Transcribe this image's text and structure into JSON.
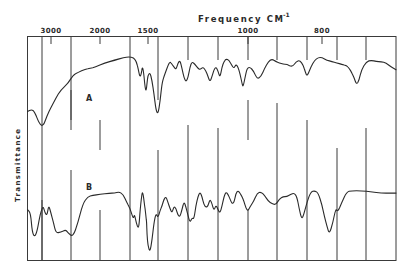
{
  "chart_data": {
    "type": "line",
    "title": "Frequency  CM",
    "title_superscript": "-1",
    "xlabel": "Frequency CM-1",
    "ylabel": "Transmittance",
    "x_axis_position": "top",
    "x_direction": "decreasing",
    "x_ticks": [
      {
        "value": 3000,
        "label": "3000"
      },
      {
        "value": 2000,
        "label": "2000"
      },
      {
        "value": 1500,
        "label": "1500"
      },
      {
        "value": 1000,
        "label": "1000"
      },
      {
        "value": 800,
        "label": "800"
      }
    ],
    "xlim": [
      3600,
      650
    ],
    "ylim": [
      0,
      100
    ],
    "grid": true,
    "legend": "inline-labels",
    "series": [
      {
        "name": "A",
        "points": [
          [
            3600,
            47
          ],
          [
            3500,
            48.5
          ],
          [
            3420,
            47
          ],
          [
            3300,
            38
          ],
          [
            3200,
            36
          ],
          [
            3100,
            44
          ],
          [
            3000,
            50
          ],
          [
            2900,
            57
          ],
          [
            2800,
            63
          ],
          [
            2650,
            68
          ],
          [
            2550,
            74
          ],
          [
            2450,
            76
          ],
          [
            2300,
            78.5
          ],
          [
            2200,
            79
          ],
          [
            2100,
            80
          ],
          [
            1950,
            83
          ],
          [
            1850,
            85
          ],
          [
            1750,
            87
          ],
          [
            1700,
            87.5
          ],
          [
            1650,
            87
          ],
          [
            1620,
            84
          ],
          [
            1600,
            78
          ],
          [
            1590,
            74
          ],
          [
            1580,
            73
          ],
          [
            1570,
            75
          ],
          [
            1560,
            80
          ],
          [
            1550,
            78
          ],
          [
            1540,
            72
          ],
          [
            1530,
            65
          ],
          [
            1520,
            62
          ],
          [
            1510,
            68
          ],
          [
            1500,
            74
          ],
          [
            1490,
            76
          ],
          [
            1480,
            70
          ],
          [
            1470,
            60
          ],
          [
            1460,
            48
          ],
          [
            1450,
            45
          ],
          [
            1440,
            54
          ],
          [
            1430,
            68
          ],
          [
            1420,
            73
          ],
          [
            1410,
            77
          ],
          [
            1400,
            81
          ],
          [
            1390,
            84
          ],
          [
            1380,
            82
          ],
          [
            1370,
            80
          ],
          [
            1360,
            78
          ],
          [
            1350,
            83
          ],
          [
            1340,
            85
          ],
          [
            1330,
            79
          ],
          [
            1320,
            72
          ],
          [
            1310,
            69
          ],
          [
            1300,
            72
          ],
          [
            1290,
            80
          ],
          [
            1280,
            84
          ],
          [
            1265,
            82
          ],
          [
            1250,
            79
          ],
          [
            1240,
            78
          ],
          [
            1225,
            80
          ],
          [
            1210,
            77
          ],
          [
            1200,
            73
          ],
          [
            1190,
            69
          ],
          [
            1180,
            73
          ],
          [
            1170,
            78
          ],
          [
            1160,
            80
          ],
          [
            1150,
            77
          ],
          [
            1140,
            72
          ],
          [
            1130,
            80
          ],
          [
            1120,
            84
          ],
          [
            1110,
            86
          ],
          [
            1095,
            85
          ],
          [
            1080,
            81
          ],
          [
            1070,
            79
          ],
          [
            1060,
            82
          ],
          [
            1050,
            80
          ],
          [
            1040,
            75
          ],
          [
            1030,
            68
          ],
          [
            1025,
            65
          ],
          [
            1015,
            72
          ],
          [
            1005,
            79
          ],
          [
            995,
            80
          ],
          [
            985,
            77
          ],
          [
            975,
            71
          ],
          [
            965,
            73
          ],
          [
            955,
            79
          ],
          [
            945,
            84
          ],
          [
            935,
            86
          ],
          [
            925,
            84
          ],
          [
            915,
            83
          ],
          [
            905,
            82
          ],
          [
            895,
            82
          ],
          [
            880,
            80
          ],
          [
            870,
            84
          ],
          [
            860,
            85
          ],
          [
            850,
            81
          ],
          [
            845,
            76
          ],
          [
            840,
            73
          ],
          [
            830,
            80
          ],
          [
            820,
            85
          ],
          [
            810,
            87
          ],
          [
            800,
            87
          ],
          [
            790,
            85
          ],
          [
            780,
            84
          ],
          [
            770,
            83
          ],
          [
            760,
            82
          ],
          [
            750,
            81
          ],
          [
            745,
            79
          ],
          [
            740,
            76
          ],
          [
            735,
            72
          ],
          [
            730,
            67
          ],
          [
            725,
            70
          ],
          [
            720,
            78
          ],
          [
            710,
            84
          ],
          [
            700,
            85
          ],
          [
            690,
            84
          ],
          [
            680,
            84
          ],
          [
            670,
            83
          ],
          [
            660,
            80
          ],
          [
            650,
            78
          ]
        ]
      },
      {
        "name": "B",
        "points": [
          [
            3600,
            41
          ],
          [
            3520,
            38
          ],
          [
            3480,
            22
          ],
          [
            3420,
            18
          ],
          [
            3360,
            22
          ],
          [
            3300,
            33
          ],
          [
            3250,
            40
          ],
          [
            3200,
            44
          ],
          [
            3150,
            38
          ],
          [
            3100,
            36
          ],
          [
            3060,
            45
          ],
          [
            3000,
            38
          ],
          [
            2950,
            30
          ],
          [
            2900,
            21
          ],
          [
            2800,
            22
          ],
          [
            2700,
            24
          ],
          [
            2650,
            21
          ],
          [
            2550,
            18
          ],
          [
            2450,
            30
          ],
          [
            2350,
            46
          ],
          [
            2250,
            52
          ],
          [
            2150,
            53
          ],
          [
            2000,
            54
          ],
          [
            1900,
            55
          ],
          [
            1850,
            55
          ],
          [
            1800,
            56
          ],
          [
            1760,
            54
          ],
          [
            1720,
            47
          ],
          [
            1700,
            44
          ],
          [
            1680,
            40
          ],
          [
            1660,
            35
          ],
          [
            1650,
            34
          ],
          [
            1640,
            37
          ],
          [
            1620,
            29
          ],
          [
            1600,
            25
          ],
          [
            1590,
            31
          ],
          [
            1580,
            42
          ],
          [
            1570,
            50
          ],
          [
            1560,
            56
          ],
          [
            1550,
            54
          ],
          [
            1540,
            47
          ],
          [
            1530,
            42
          ],
          [
            1520,
            34
          ],
          [
            1515,
            31
          ],
          [
            1510,
            20
          ],
          [
            1500,
            10
          ],
          [
            1490,
            5
          ],
          [
            1480,
            15
          ],
          [
            1470,
            30
          ],
          [
            1460,
            38
          ],
          [
            1450,
            34
          ],
          [
            1440,
            40
          ],
          [
            1430,
            44
          ],
          [
            1420,
            50
          ],
          [
            1410,
            52
          ],
          [
            1400,
            47
          ],
          [
            1390,
            42
          ],
          [
            1380,
            38
          ],
          [
            1370,
            44
          ],
          [
            1360,
            42
          ],
          [
            1350,
            36
          ],
          [
            1340,
            35
          ],
          [
            1330,
            41
          ],
          [
            1320,
            48
          ],
          [
            1310,
            43
          ],
          [
            1300,
            36
          ],
          [
            1290,
            30
          ],
          [
            1280,
            34
          ],
          [
            1270,
            33
          ],
          [
            1260,
            45
          ],
          [
            1250,
            52
          ],
          [
            1240,
            56
          ],
          [
            1230,
            52
          ],
          [
            1220,
            45
          ],
          [
            1210,
            43
          ],
          [
            1200,
            44
          ],
          [
            1190,
            50
          ],
          [
            1180,
            46
          ],
          [
            1170,
            40
          ],
          [
            1160,
            45
          ],
          [
            1150,
            41
          ],
          [
            1140,
            38
          ],
          [
            1130,
            44
          ],
          [
            1120,
            52
          ],
          [
            1110,
            56
          ],
          [
            1100,
            54
          ],
          [
            1090,
            50
          ],
          [
            1080,
            46
          ],
          [
            1070,
            47
          ],
          [
            1060,
            55
          ],
          [
            1050,
            57
          ],
          [
            1040,
            55
          ],
          [
            1030,
            52
          ],
          [
            1020,
            48
          ],
          [
            1010,
            42
          ],
          [
            1000,
            40
          ],
          [
            995,
            43
          ],
          [
            985,
            48
          ],
          [
            975,
            55
          ],
          [
            965,
            56
          ],
          [
            955,
            53
          ],
          [
            945,
            48
          ],
          [
            935,
            46
          ],
          [
            925,
            45
          ],
          [
            915,
            50
          ],
          [
            905,
            52
          ],
          [
            895,
            52
          ],
          [
            885,
            54
          ],
          [
            875,
            55
          ],
          [
            868,
            52
          ],
          [
            862,
            42
          ],
          [
            855,
            33
          ],
          [
            850,
            36
          ],
          [
            840,
            48
          ],
          [
            830,
            56
          ],
          [
            820,
            57
          ],
          [
            810,
            55
          ],
          [
            800,
            45
          ],
          [
            795,
            35
          ],
          [
            790,
            27
          ],
          [
            785,
            20
          ],
          [
            778,
            30
          ],
          [
            772,
            42
          ],
          [
            768,
            39
          ],
          [
            760,
            47
          ],
          [
            750,
            56
          ],
          [
            740,
            57
          ],
          [
            720,
            57
          ],
          [
            700,
            56
          ],
          [
            680,
            55
          ],
          [
            660,
            55
          ],
          [
            650,
            55
          ]
        ]
      }
    ],
    "annotations": [
      {
        "text": "A",
        "series": "A",
        "x": 2350
      },
      {
        "text": "B",
        "series": "B",
        "x": 2350
      }
    ]
  }
}
